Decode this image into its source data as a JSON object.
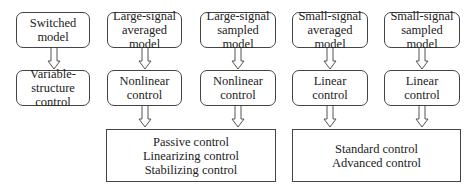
{
  "diagram": {
    "columns": [
      {
        "model": "Switched\nmodel",
        "control": "Variable-\nstructure control"
      },
      {
        "model": "Large-signal\naveraged model",
        "control": "Nonlinear\ncontrol"
      },
      {
        "model": "Large-signal\nsampled model",
        "control": "Nonlinear\ncontrol"
      },
      {
        "model": "Small-signal\naveraged model",
        "control": "Linear\ncontrol"
      },
      {
        "model": "Small-signal\nsampled model",
        "control": "Linear\ncontrol"
      }
    ],
    "groups": [
      {
        "label": "Passive control\nLinearizing control\nStabilizing control"
      },
      {
        "label": "Standard control\nAdvanced control"
      }
    ],
    "colors": {
      "border": "#444444",
      "arrow": "#555555",
      "background": "#ffffff"
    }
  }
}
